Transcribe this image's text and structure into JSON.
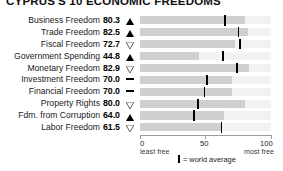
{
  "title": "CYPRUS'S 10 ECONOMIC FREEDOMS",
  "axis": {
    "min_label": "0",
    "mid_label": "50",
    "max_label": "100",
    "min_sub": "least free",
    "max_sub": "most free"
  },
  "legend": {
    "marker": "|",
    "text": "= world average"
  },
  "colors": {
    "bar_fill": "#cfcfcf",
    "bar_track": "#f2f2f2",
    "average_mark": "#000000",
    "axis": "#9a9a9a"
  },
  "chart_data": {
    "type": "bar",
    "title": "CYPRUS'S 10 ECONOMIC FREEDOMS",
    "xlabel": "",
    "ylabel": "",
    "xlim": [
      0,
      100
    ],
    "grid": false,
    "orientation": "horizontal",
    "categories": [
      "Business Freedom",
      "Trade Freedom",
      "Fiscal Freedom",
      "Government Spending",
      "Monetary Freedom",
      "Investment Freedom",
      "Financial Freedom",
      "Property Rights",
      "Fdm. from Corruption",
      "Labor Freedom"
    ],
    "values": [
      80.3,
      82.5,
      72.7,
      44.8,
      82.9,
      70.0,
      70.0,
      80.0,
      64.0,
      61.5
    ],
    "value_labels": [
      "80.3",
      "82.5",
      "72.7",
      "44.8",
      "82.9",
      "70.0",
      "70.0",
      "80.0",
      "64.0",
      "61.5"
    ],
    "trend": [
      "up",
      "up",
      "down",
      "up",
      "down",
      "flat",
      "flat",
      "down",
      "up",
      "down"
    ],
    "trend_icons": [
      "triangle-up-filled-icon",
      "triangle-up-filled-icon",
      "triangle-down-hollow-icon",
      "triangle-up-filled-icon",
      "triangle-down-hollow-icon",
      "dash-icon",
      "dash-icon",
      "triangle-down-hollow-icon",
      "triangle-up-filled-icon",
      "triangle-down-hollow-icon"
    ],
    "world_average": [
      64.3,
      74.5,
      75.4,
      62.7,
      73.4,
      50.2,
      48.5,
      43.6,
      40.5,
      61.5
    ],
    "series": [
      {
        "name": "Cyprus score",
        "values": [
          80.3,
          82.5,
          72.7,
          44.8,
          82.9,
          70.0,
          70.0,
          80.0,
          64.0,
          61.5
        ]
      },
      {
        "name": "World average",
        "values": [
          64.3,
          74.5,
          75.4,
          62.7,
          73.4,
          50.2,
          48.5,
          43.6,
          40.5,
          61.5
        ]
      }
    ]
  }
}
